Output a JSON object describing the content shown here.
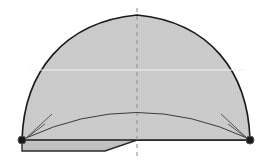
{
  "canvas": {
    "width": 275,
    "height": 167,
    "background_color": "#ffffff",
    "title": "Dome cross-section with sweep arc"
  },
  "style": {
    "fill_color": "#c8c8c8",
    "fill_stripe_color": "#d0d0d0",
    "outline_color": "#1a1a1a",
    "outline_width": 1.6,
    "inner_arc_color": "#3a3a3a",
    "inner_arc_width": 1.0,
    "centerline_color": "#8a8a8a",
    "centerline_dash": "4 4",
    "highlight_line_color": "#f2f2f2",
    "node_fill_color": "#1a1a1a",
    "node_ring_color": "#555555",
    "base_band_color": "#c2c2c2"
  },
  "geometry": {
    "dome": {
      "apex": {
        "x": 137,
        "y": 15
      },
      "left_base": {
        "x": 22,
        "y": 140
      },
      "right_base": {
        "x": 250,
        "y": 140
      },
      "left_control": {
        "x": 28,
        "y": 48
      },
      "right_control": {
        "x": 246,
        "y": 48
      },
      "path": "M 22 140 C 24 72 64 22 137 15 C 210 22 248 72 250 140 Z"
    },
    "centerline": {
      "x": 137,
      "y_top": 8,
      "y_bottom": 160
    },
    "highlight_line": {
      "y": 70,
      "x_start": 30,
      "x_end": 244
    },
    "inner_arc": {
      "start": {
        "x": 26,
        "y": 138
      },
      "peak": {
        "x": 137,
        "y": 97
      },
      "end": {
        "x": 247,
        "y": 138
      },
      "path": "M 26 138 Q 137 87 247 138"
    },
    "arrowheads": [
      {
        "name": "left-arrowhead",
        "tip": {
          "x": 25,
          "y": 139
        },
        "path": "M 25 139 L 52 114 M 25 139 L 45 124"
      },
      {
        "name": "right-arrowhead",
        "tip": {
          "x": 248,
          "y": 139
        },
        "path": "M 248 139 L 221 114 M 248 139 L 228 124"
      }
    ],
    "base_band": {
      "path": "M 22 140 L 22 151 L 105 151 L 137 140 L 250 140 L 250 137 L 22 137 Z",
      "step_start_x": 105,
      "step_end_x": 137,
      "lower_y": 151,
      "upper_y": 140
    },
    "nodes": [
      {
        "name": "left-node",
        "x": 22,
        "y": 140,
        "radius": 4
      },
      {
        "name": "right-node",
        "x": 250,
        "y": 140,
        "radius": 4
      }
    ]
  },
  "labels": {
    "left_node": "",
    "right_node": "",
    "apex": "",
    "arc": ""
  }
}
